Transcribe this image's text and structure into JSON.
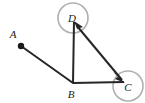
{
  "figure": {
    "canvas": {
      "width": 145,
      "height": 103,
      "background": "#ffffff"
    },
    "colors": {
      "stroke": "#262626",
      "label": "#1a1a1a",
      "highlight_circle": "#b0b0b0"
    },
    "points": [
      {
        "id": "A",
        "label": "A",
        "x": 20,
        "y": 45,
        "label_x": 13,
        "label_y": 38,
        "has_dot": true,
        "circled": false
      },
      {
        "id": "B",
        "label": "B",
        "x": 73,
        "y": 83,
        "label_x": 70,
        "label_y": 97,
        "has_dot": false,
        "circled": false
      },
      {
        "id": "C",
        "label": "C",
        "x": 124,
        "y": 82,
        "label_x": 125,
        "label_y": 92,
        "has_dot": false,
        "circled": true,
        "circle_cx": 128,
        "circle_cy": 86,
        "circle_r": 15
      },
      {
        "id": "D",
        "label": "D",
        "x": 75,
        "y": 24,
        "label_x": 70,
        "label_y": 22,
        "has_dot": false,
        "circled": true,
        "circle_cx": 73,
        "circle_cy": 18,
        "circle_r": 15
      }
    ],
    "segments": [
      {
        "id": "AB",
        "from": "A",
        "to": "B",
        "x1": 21,
        "y1": 46,
        "x2": 73,
        "y2": 83,
        "arrow_start": false,
        "arrow_end": false
      },
      {
        "id": "BD",
        "from": "B",
        "to": "D",
        "x1": 73,
        "y1": 83,
        "x2": 74,
        "y2": 22,
        "arrow_start": false,
        "arrow_end": false
      },
      {
        "id": "BC",
        "from": "B",
        "to": "C",
        "x1": 73,
        "y1": 83,
        "x2": 124,
        "y2": 82,
        "arrow_start": false,
        "arrow_end": false
      },
      {
        "id": "DC",
        "from": "D",
        "to": "C",
        "x1": 76,
        "y1": 24,
        "x2": 123,
        "y2": 81,
        "arrow_start": true,
        "arrow_end": true
      }
    ]
  }
}
